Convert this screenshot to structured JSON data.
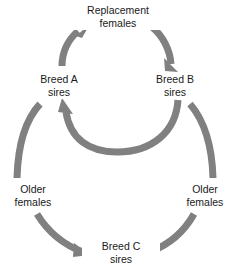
{
  "diagram": {
    "arrow_color": "#808080",
    "text_color": "#1a1a1a",
    "background": "#ffffff",
    "nodes": [
      {
        "id": "breed-a-sires",
        "line1": "Breed A",
        "line2": "sires"
      },
      {
        "id": "breed-b-sires",
        "line1": "Breed B",
        "line2": "sires"
      },
      {
        "id": "breed-c-sires",
        "line1": "Breed C",
        "line2": "sires"
      }
    ],
    "edge_labels": [
      {
        "id": "replacement-females",
        "line1": "Replacement",
        "line2": "females"
      },
      {
        "id": "older-females-left",
        "line1": "Older",
        "line2": "females"
      },
      {
        "id": "older-females-right",
        "line1": "Older",
        "line2": "females"
      }
    ],
    "flows": [
      {
        "from": "breed-a-sires",
        "to": "breed-b-sires",
        "label": "Replacement females"
      },
      {
        "from": "breed-b-sires",
        "to": "breed-a-sires",
        "label": ""
      },
      {
        "from": "breed-a-sires",
        "to": "breed-c-sires",
        "label": "Older females"
      },
      {
        "from": "breed-b-sires",
        "to": "breed-c-sires",
        "label": "Older females"
      }
    ]
  }
}
